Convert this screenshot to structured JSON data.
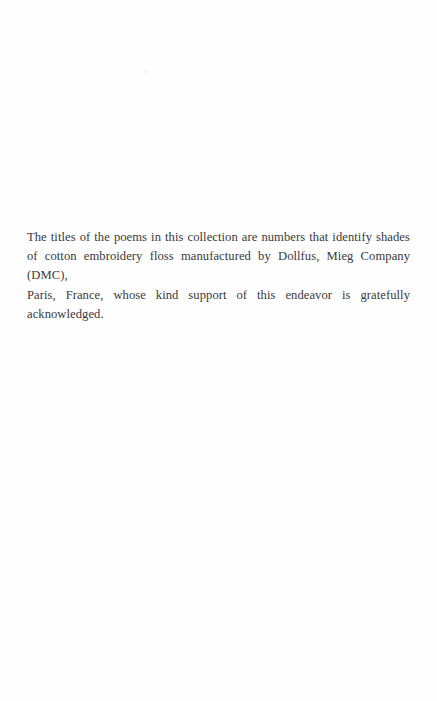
{
  "page": {
    "background_color": "#fefefe",
    "text_color": "#3a3a3c",
    "width": 437,
    "height": 701
  },
  "note": {
    "full_text": "The titles of the poems in this collection are numbers that identify shades of cotton embroidery floss manufactured by Dollfus, Mieg Company (DMC), Paris, France, whose kind support of this endeavor is gratefully acknowledged.",
    "lines": [
      "The titles of the poems in this collection are numbers that identify shades",
      "of cotton embroidery floss manufactured by Dollfus, Mieg Company (DMC),",
      "Paris, France, whose kind support of this endeavor is gratefully acknowledged."
    ]
  }
}
